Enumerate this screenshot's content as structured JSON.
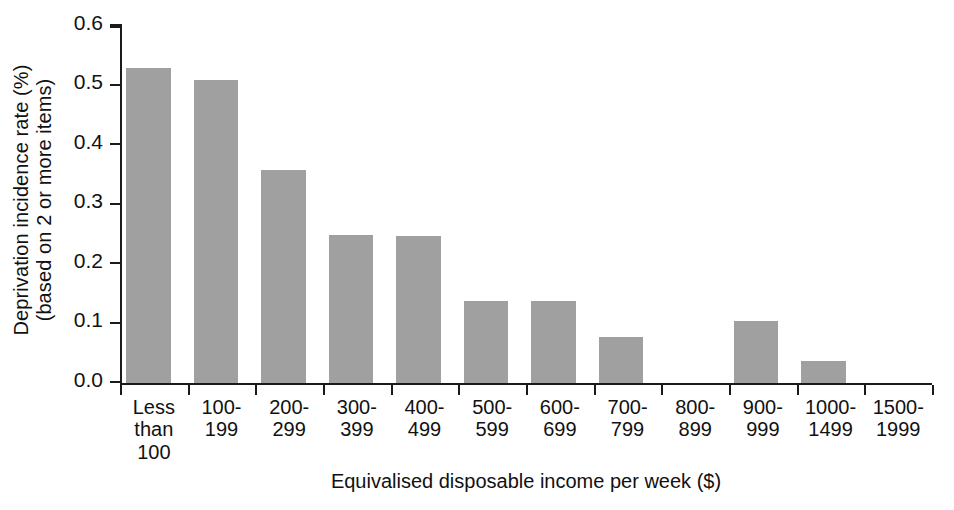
{
  "chart_data": {
    "type": "bar",
    "title": "",
    "xlabel": "Equivalised disposable income per week ($)",
    "ylabel": "Deprivation incidence rate (%) (based on 2 or more items)",
    "ylabel_line1": "Deprivation incidence rate (%)",
    "ylabel_line2": "(based on 2 or more items)",
    "categories": [
      "Less\nthan\n100",
      "100-\n199",
      "200-\n299",
      "300-\n399",
      "400-\n499",
      "500-\n599",
      "600-\n699",
      "700-\n799",
      "800-\n899",
      "900-\n999",
      "1000-\n1499",
      "1500-\n1999"
    ],
    "values": [
      0.53,
      0.51,
      0.358,
      0.249,
      0.247,
      0.138,
      0.138,
      0.078,
      0.0,
      0.105,
      0.037,
      0.0
    ],
    "ylim": [
      0.0,
      0.6
    ],
    "ytick_values": [
      0.0,
      0.1,
      0.2,
      0.3,
      0.4,
      0.5,
      0.6
    ],
    "ytick_labels": [
      "0.0",
      "0.1",
      "0.2",
      "0.3",
      "0.4",
      "0.5",
      "0.6"
    ],
    "grid": false,
    "legend": false,
    "bar_color": "#a0a0a0",
    "axis_color": "#1a1a1a"
  }
}
